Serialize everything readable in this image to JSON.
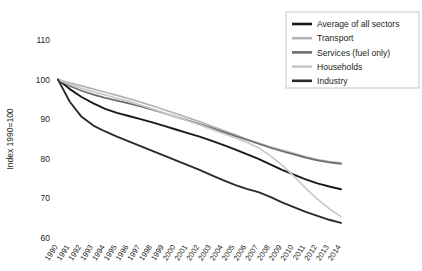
{
  "chart_data": {
    "type": "line",
    "title": "",
    "xlabel": "",
    "ylabel": "Index 1990=100",
    "ylim": [
      60,
      110
    ],
    "yticks": [
      60,
      70,
      80,
      90,
      100,
      110
    ],
    "grid": false,
    "legend_position": "top-right",
    "x": [
      1990,
      1991,
      1992,
      1993,
      1994,
      1995,
      1996,
      1997,
      1998,
      1999,
      2000,
      2001,
      2002,
      2003,
      2004,
      2005,
      2006,
      2007,
      2008,
      2009,
      2010,
      2011,
      2012,
      2013,
      2014
    ],
    "xtick_labels": [
      "1990",
      "1991",
      "1992",
      "1993",
      "1994",
      "1995",
      "1996",
      "1997",
      "1998",
      "1999",
      "2000",
      "2001",
      "2002",
      "2003",
      "2004",
      "2005",
      "2006",
      "2007",
      "2008",
      "2009",
      "2010",
      "2011",
      "2012",
      "2013",
      "2014"
    ],
    "series": [
      {
        "name": "Average of all sectors",
        "color": "#1a1a1a",
        "width": 1.9,
        "values": [
          100.0,
          97.6,
          95.6,
          94.0,
          92.6,
          91.6,
          90.8,
          90.0,
          89.2,
          88.3,
          87.4,
          86.5,
          85.6,
          84.6,
          83.5,
          82.4,
          81.2,
          80.0,
          78.6,
          77.2,
          76.0,
          74.8,
          73.8,
          73.0,
          72.3
        ]
      },
      {
        "name": "Transport",
        "color": "#b4b4b4",
        "width": 1.7,
        "values": [
          100.0,
          99.2,
          98.4,
          97.6,
          96.8,
          96.0,
          95.2,
          94.3,
          93.4,
          92.4,
          91.4,
          90.4,
          89.4,
          88.3,
          87.2,
          86.1,
          85.0,
          84.0,
          83.0,
          82.2,
          81.4,
          80.5,
          79.8,
          79.3,
          79.0
        ]
      },
      {
        "name": "Services (fuel only)",
        "color": "#6e6e6e",
        "width": 1.7,
        "values": [
          100.0,
          98.4,
          97.2,
          96.2,
          95.4,
          94.7,
          94.0,
          93.2,
          92.4,
          91.5,
          90.6,
          89.7,
          88.8,
          87.8,
          86.8,
          85.8,
          84.8,
          83.8,
          82.8,
          81.9,
          81.1,
          80.3,
          79.6,
          79.1,
          78.7
        ]
      },
      {
        "name": "Households",
        "color": "#c8c8c8",
        "width": 1.7,
        "values": [
          100.0,
          98.8,
          97.8,
          96.9,
          96.1,
          95.3,
          94.5,
          93.6,
          92.6,
          91.6,
          90.6,
          89.6,
          88.6,
          87.5,
          86.4,
          85.3,
          84.2,
          82.8,
          80.8,
          78.4,
          75.6,
          72.6,
          69.8,
          67.4,
          65.4
        ]
      },
      {
        "name": "Industry",
        "color": "#2b2b2b",
        "width": 1.9,
        "values": [
          100.0,
          94.4,
          90.6,
          88.4,
          86.9,
          85.6,
          84.4,
          83.2,
          82.0,
          80.8,
          79.6,
          78.4,
          77.2,
          75.9,
          74.6,
          73.4,
          72.4,
          71.6,
          70.4,
          69.0,
          67.8,
          66.6,
          65.6,
          64.6,
          63.8
        ]
      }
    ]
  },
  "legend": {
    "items": [
      {
        "label": "Average of all sectors",
        "color": "#1a1a1a"
      },
      {
        "label": "Transport",
        "color": "#b4b4b4"
      },
      {
        "label": "Services (fuel only)",
        "color": "#6e6e6e"
      },
      {
        "label": "Households",
        "color": "#c8c8c8"
      },
      {
        "label": "Industry",
        "color": "#2b2b2b"
      }
    ]
  }
}
